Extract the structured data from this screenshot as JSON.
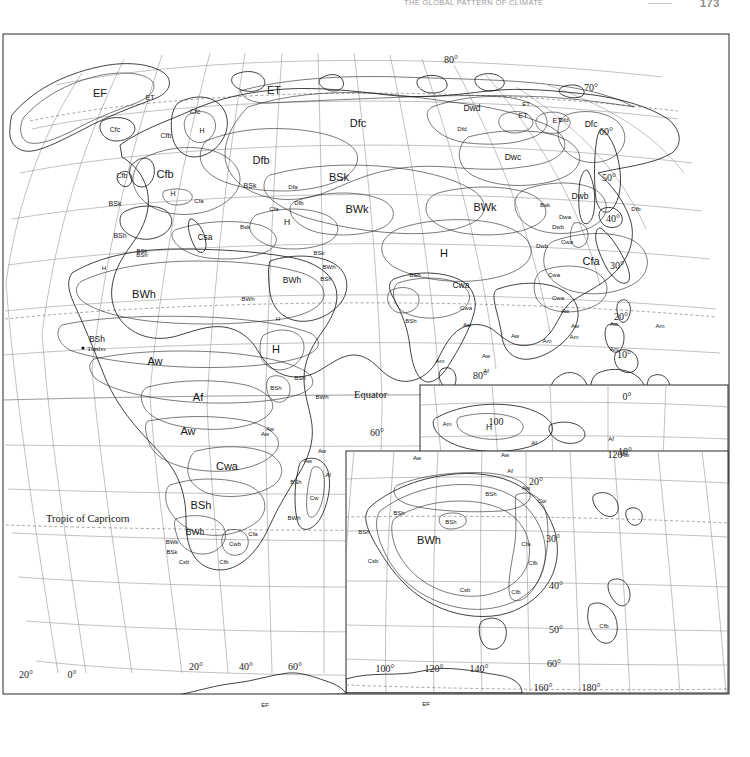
{
  "header": {
    "title": "The Global Pattern of Climate",
    "folio": "173"
  },
  "map": {
    "projection_note": "Eastern Hemisphere Koppen climate classification plate",
    "named_features": [
      {
        "label": "Equator",
        "x": 352,
        "y": 365
      },
      {
        "label": "Tropic of Capricorn",
        "x": 44,
        "y": 489
      }
    ],
    "cities": [
      {
        "label": "Timbo",
        "x": 85,
        "y": 318
      }
    ],
    "graticule_labels": [
      {
        "label": "80°",
        "x": 449,
        "y": 30
      },
      {
        "label": "70°",
        "x": 589,
        "y": 58
      },
      {
        "label": "60°",
        "x": 604,
        "y": 102
      },
      {
        "label": "50°",
        "x": 607,
        "y": 148
      },
      {
        "label": "40°",
        "x": 611,
        "y": 189
      },
      {
        "label": "30°",
        "x": 615,
        "y": 236
      },
      {
        "label": "20°",
        "x": 619,
        "y": 287
      },
      {
        "label": "10°",
        "x": 622,
        "y": 325
      },
      {
        "label": "0°",
        "x": 625,
        "y": 367
      },
      {
        "label": "10°",
        "x": 623,
        "y": 422
      },
      {
        "label": "80°",
        "x": 478,
        "y": 346
      },
      {
        "label": "100",
        "x": 494,
        "y": 392
      },
      {
        "label": "120°",
        "x": 615,
        "y": 425
      },
      {
        "label": "20°",
        "x": 24,
        "y": 645
      },
      {
        "label": "0°",
        "x": 70,
        "y": 645
      },
      {
        "label": "20°",
        "x": 194,
        "y": 637
      },
      {
        "label": "40°",
        "x": 244,
        "y": 637
      },
      {
        "label": "60°",
        "x": 293,
        "y": 637
      },
      {
        "label": "100°",
        "x": 383,
        "y": 639
      },
      {
        "label": "120°",
        "x": 432,
        "y": 639
      },
      {
        "label": "140°",
        "x": 477,
        "y": 639
      },
      {
        "label": "160°",
        "x": 541,
        "y": 658
      },
      {
        "label": "180°",
        "x": 589,
        "y": 658
      },
      {
        "label": "20°",
        "x": 534,
        "y": 452
      },
      {
        "label": "30°",
        "x": 551,
        "y": 509
      },
      {
        "label": "40°",
        "x": 554,
        "y": 556
      },
      {
        "label": "50°",
        "x": 554,
        "y": 600
      },
      {
        "label": "60°",
        "x": 552,
        "y": 634
      },
      {
        "label": "60°",
        "x": 375,
        "y": 403
      }
    ],
    "climate_labels": [
      {
        "code": "EF",
        "x": 98,
        "y": 64,
        "size": "lg"
      },
      {
        "code": "ET",
        "x": 148,
        "y": 67,
        "size": "sm"
      },
      {
        "code": "ET",
        "x": 272,
        "y": 61,
        "size": "lg"
      },
      {
        "code": "ET",
        "x": 521,
        "y": 85,
        "size": "sm"
      },
      {
        "code": "ET",
        "x": 555,
        "y": 90,
        "size": "sm"
      },
      {
        "code": "ET",
        "x": 524,
        "y": 73,
        "size": "xs"
      },
      {
        "code": "Cfc",
        "x": 193,
        "y": 81,
        "size": "sm"
      },
      {
        "code": "Cfc",
        "x": 113,
        "y": 99,
        "size": "sm"
      },
      {
        "code": "Cfb",
        "x": 164,
        "y": 105,
        "size": "sm"
      },
      {
        "code": "H",
        "x": 200,
        "y": 100,
        "size": "sm"
      },
      {
        "code": "Dfc",
        "x": 356,
        "y": 94,
        "size": "lg"
      },
      {
        "code": "Dwd",
        "x": 470,
        "y": 78,
        "size": "md"
      },
      {
        "code": "Dfd",
        "x": 460,
        "y": 98,
        "size": "xs"
      },
      {
        "code": "Dfd",
        "x": 562,
        "y": 89,
        "size": "xs"
      },
      {
        "code": "Dfc",
        "x": 589,
        "y": 94,
        "size": "md"
      },
      {
        "code": "Dwc",
        "x": 511,
        "y": 127,
        "size": "md"
      },
      {
        "code": "Dfb",
        "x": 259,
        "y": 131,
        "size": "lg"
      },
      {
        "code": "Cfb",
        "x": 120,
        "y": 145,
        "size": "sm"
      },
      {
        "code": "BSk",
        "x": 113,
        "y": 173,
        "size": "sm"
      },
      {
        "code": "BSh",
        "x": 118,
        "y": 205,
        "size": "sm"
      },
      {
        "code": "BSk",
        "x": 140,
        "y": 220,
        "size": "xs"
      },
      {
        "code": "Cfb",
        "x": 163,
        "y": 145,
        "size": "lg"
      },
      {
        "code": "Cfa",
        "x": 197,
        "y": 170,
        "size": "xs"
      },
      {
        "code": "H",
        "x": 171,
        "y": 163,
        "size": "sm"
      },
      {
        "code": "BSk",
        "x": 248,
        "y": 155,
        "size": "sm"
      },
      {
        "code": "Dfa",
        "x": 291,
        "y": 156,
        "size": "xs"
      },
      {
        "code": "Dfb",
        "x": 297,
        "y": 172,
        "size": "xs"
      },
      {
        "code": "Cfa",
        "x": 272,
        "y": 178,
        "size": "xs"
      },
      {
        "code": "Bsk",
        "x": 243,
        "y": 196,
        "size": "xs"
      },
      {
        "code": "Csa",
        "x": 203,
        "y": 207,
        "size": "md"
      },
      {
        "code": "BSk",
        "x": 337,
        "y": 148,
        "size": "lg"
      },
      {
        "code": "BWk",
        "x": 355,
        "y": 180,
        "size": "lg"
      },
      {
        "code": "BWk",
        "x": 483,
        "y": 178,
        "size": "lg"
      },
      {
        "code": "H",
        "x": 285,
        "y": 192,
        "size": "md"
      },
      {
        "code": "Dwb",
        "x": 578,
        "y": 166,
        "size": "md"
      },
      {
        "code": "Bsk",
        "x": 543,
        "y": 174,
        "size": "xs"
      },
      {
        "code": "Dwa",
        "x": 563,
        "y": 186,
        "size": "xs"
      },
      {
        "code": "Dwb",
        "x": 556,
        "y": 196,
        "size": "xs"
      },
      {
        "code": "Dfb",
        "x": 634,
        "y": 178,
        "size": "xs"
      },
      {
        "code": "Dwb",
        "x": 540,
        "y": 215,
        "size": "xs"
      },
      {
        "code": "Cwa",
        "x": 565,
        "y": 211,
        "size": "xs"
      },
      {
        "code": "Cfa",
        "x": 589,
        "y": 232,
        "size": "lg"
      },
      {
        "code": "H",
        "x": 442,
        "y": 224,
        "size": "lg"
      },
      {
        "code": "BSh",
        "x": 413,
        "y": 244,
        "size": "xs"
      },
      {
        "code": "BSk",
        "x": 317,
        "y": 222,
        "size": "xs"
      },
      {
        "code": "BWh",
        "x": 327,
        "y": 236,
        "size": "xs"
      },
      {
        "code": "BSh",
        "x": 324,
        "y": 248,
        "size": "xs"
      },
      {
        "code": "Cwa",
        "x": 459,
        "y": 255,
        "size": "md"
      },
      {
        "code": "Cwa",
        "x": 464,
        "y": 277,
        "size": "xs"
      },
      {
        "code": "BSh",
        "x": 409,
        "y": 290,
        "size": "xs"
      },
      {
        "code": "Aw",
        "x": 465,
        "y": 294,
        "size": "xs"
      },
      {
        "code": "Am",
        "x": 438,
        "y": 330,
        "size": "xs"
      },
      {
        "code": "Aw",
        "x": 484,
        "y": 325,
        "size": "xs"
      },
      {
        "code": "Af",
        "x": 484,
        "y": 340,
        "size": "xs"
      },
      {
        "code": "Aw",
        "x": 513,
        "y": 305,
        "size": "xs"
      },
      {
        "code": "Am",
        "x": 545,
        "y": 310,
        "size": "xs"
      },
      {
        "code": "Cwa",
        "x": 552,
        "y": 244,
        "size": "xs"
      },
      {
        "code": "Cwa",
        "x": 556,
        "y": 267,
        "size": "xs"
      },
      {
        "code": "Aw",
        "x": 563,
        "y": 280,
        "size": "xs"
      },
      {
        "code": "Aw",
        "x": 573,
        "y": 295,
        "size": "xs"
      },
      {
        "code": "Am",
        "x": 572,
        "y": 306,
        "size": "xs"
      },
      {
        "code": "Aw",
        "x": 612,
        "y": 293,
        "size": "xs"
      },
      {
        "code": "Am",
        "x": 658,
        "y": 295,
        "size": "xs"
      },
      {
        "code": "Am",
        "x": 612,
        "y": 318,
        "size": "xs"
      },
      {
        "code": "Af",
        "x": 609,
        "y": 408,
        "size": "xs"
      },
      {
        "code": "Aw",
        "x": 623,
        "y": 424,
        "size": "xs"
      },
      {
        "code": "BWh",
        "x": 142,
        "y": 265,
        "size": "lg"
      },
      {
        "code": "BWh",
        "x": 290,
        "y": 250,
        "size": "md"
      },
      {
        "code": "BWh",
        "x": 246,
        "y": 268,
        "size": "xs"
      },
      {
        "code": "BSh",
        "x": 95,
        "y": 309,
        "size": "md"
      },
      {
        "code": "H",
        "x": 102,
        "y": 237,
        "size": "xs"
      },
      {
        "code": "BSh",
        "x": 140,
        "y": 224,
        "size": "xs"
      },
      {
        "code": "Aw",
        "x": 153,
        "y": 332,
        "size": "lg"
      },
      {
        "code": "Af",
        "x": 196,
        "y": 368,
        "size": "lg"
      },
      {
        "code": "H",
        "x": 274,
        "y": 320,
        "size": "lg"
      },
      {
        "code": "H",
        "x": 276,
        "y": 288,
        "size": "xs"
      },
      {
        "code": "BSh",
        "x": 298,
        "y": 347,
        "size": "xs"
      },
      {
        "code": "BSh",
        "x": 274,
        "y": 357,
        "size": "xs"
      },
      {
        "code": "BWh",
        "x": 320,
        "y": 366,
        "size": "xs"
      },
      {
        "code": "Aw",
        "x": 186,
        "y": 402,
        "size": "lg"
      },
      {
        "code": "Aw",
        "x": 268,
        "y": 398,
        "size": "xs"
      },
      {
        "code": "Cwa",
        "x": 225,
        "y": 437,
        "size": "lg"
      },
      {
        "code": "Aw",
        "x": 263,
        "y": 403,
        "size": "xs"
      },
      {
        "code": "BSh",
        "x": 199,
        "y": 476,
        "size": "lg"
      },
      {
        "code": "Cwb",
        "x": 233,
        "y": 513,
        "size": "xs"
      },
      {
        "code": "BWh",
        "x": 193,
        "y": 502,
        "size": "md"
      },
      {
        "code": "BWk",
        "x": 170,
        "y": 511,
        "size": "xs"
      },
      {
        "code": "BSk",
        "x": 170,
        "y": 521,
        "size": "xs"
      },
      {
        "code": "Csb",
        "x": 182,
        "y": 531,
        "size": "xs"
      },
      {
        "code": "Cfb",
        "x": 222,
        "y": 531,
        "size": "xs"
      },
      {
        "code": "Cfa",
        "x": 251,
        "y": 503,
        "size": "xs"
      },
      {
        "code": "Aw",
        "x": 320,
        "y": 420,
        "size": "xs"
      },
      {
        "code": "Aw",
        "x": 306,
        "y": 430,
        "size": "xs"
      },
      {
        "code": "Af",
        "x": 326,
        "y": 444,
        "size": "xs"
      },
      {
        "code": "BSh",
        "x": 294,
        "y": 451,
        "size": "xs"
      },
      {
        "code": "Cw",
        "x": 312,
        "y": 467,
        "size": "xs"
      },
      {
        "code": "BWh",
        "x": 292,
        "y": 487,
        "size": "xs"
      },
      {
        "code": "Am",
        "x": 445,
        "y": 393,
        "size": "xs"
      },
      {
        "code": "H",
        "x": 487,
        "y": 397,
        "size": "md"
      },
      {
        "code": "Af",
        "x": 532,
        "y": 412,
        "size": "xs"
      },
      {
        "code": "Aw",
        "x": 415,
        "y": 427,
        "size": "xs"
      },
      {
        "code": "Aw",
        "x": 503,
        "y": 424,
        "size": "xs"
      },
      {
        "code": "Af",
        "x": 508,
        "y": 440,
        "size": "xs"
      },
      {
        "code": "Aw",
        "x": 524,
        "y": 457,
        "size": "xs"
      },
      {
        "code": "BSh",
        "x": 489,
        "y": 463,
        "size": "xs"
      },
      {
        "code": "Cw",
        "x": 540,
        "y": 470,
        "size": "xs"
      },
      {
        "code": "BSh",
        "x": 397,
        "y": 482,
        "size": "xs"
      },
      {
        "code": "BSh",
        "x": 449,
        "y": 491,
        "size": "xs"
      },
      {
        "code": "BWh",
        "x": 427,
        "y": 511,
        "size": "lg"
      },
      {
        "code": "BSh",
        "x": 362,
        "y": 501,
        "size": "xs"
      },
      {
        "code": "Csb",
        "x": 371,
        "y": 530,
        "size": "xs"
      },
      {
        "code": "Cfa",
        "x": 524,
        "y": 513,
        "size": "xs"
      },
      {
        "code": "Cfb",
        "x": 531,
        "y": 532,
        "size": "xs"
      },
      {
        "code": "Csb",
        "x": 463,
        "y": 559,
        "size": "xs"
      },
      {
        "code": "Cfb",
        "x": 514,
        "y": 561,
        "size": "xs"
      },
      {
        "code": "Cfb",
        "x": 602,
        "y": 595,
        "size": "xs"
      },
      {
        "code": "EF",
        "x": 263,
        "y": 674,
        "size": "xs"
      },
      {
        "code": "EF",
        "x": 424,
        "y": 673,
        "size": "xs"
      }
    ]
  },
  "legend": {
    "koppen_codes": [
      {
        "code": "Af",
        "name": "Tropical rainforest"
      },
      {
        "code": "Am",
        "name": "Tropical monsoon"
      },
      {
        "code": "Aw",
        "name": "Tropical savanna"
      },
      {
        "code": "BWh",
        "name": "Hot desert"
      },
      {
        "code": "BWk",
        "name": "Cold desert"
      },
      {
        "code": "BSh",
        "name": "Hot steppe"
      },
      {
        "code": "BSk",
        "name": "Cold steppe"
      },
      {
        "code": "Csa",
        "name": "Mediterranean hot summer"
      },
      {
        "code": "Csb",
        "name": "Mediterranean warm summer"
      },
      {
        "code": "Cwa",
        "name": "Humid subtropical dry winter"
      },
      {
        "code": "Cwb",
        "name": "Subtropical highland"
      },
      {
        "code": "Cfa",
        "name": "Humid subtropical"
      },
      {
        "code": "Cfb",
        "name": "Oceanic"
      },
      {
        "code": "Cfc",
        "name": "Subpolar oceanic"
      },
      {
        "code": "Dfa",
        "name": "Hot summer humid continental"
      },
      {
        "code": "Dfb",
        "name": "Warm summer humid continental"
      },
      {
        "code": "Dfc",
        "name": "Subarctic"
      },
      {
        "code": "Dfd",
        "name": "Extremely cold subarctic"
      },
      {
        "code": "Dwa",
        "name": "Monsoon humid continental"
      },
      {
        "code": "Dwb",
        "name": "Monsoon warm continental"
      },
      {
        "code": "Dwc",
        "name": "Monsoon subarctic"
      },
      {
        "code": "Dwd",
        "name": "Monsoon extremely cold subarctic"
      },
      {
        "code": "ET",
        "name": "Tundra"
      },
      {
        "code": "EF",
        "name": "Ice cap"
      },
      {
        "code": "H",
        "name": "Highland"
      }
    ]
  }
}
